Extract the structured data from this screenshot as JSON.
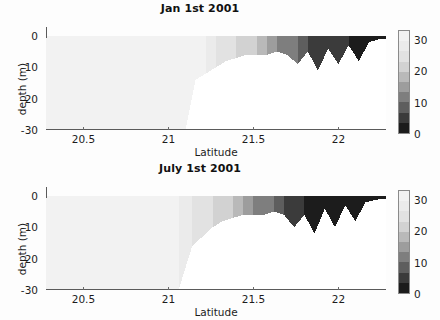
{
  "figure": {
    "background": "#fdfdfd",
    "width": 440,
    "height": 320
  },
  "panels": [
    {
      "key": "jan",
      "title": "Jan 1st 2001",
      "xlabel": "Latitude",
      "ylabel": "depth (m)"
    },
    {
      "key": "july",
      "title": "July 1st 2001",
      "xlabel": "Latitude",
      "ylabel": "depth (m)"
    }
  ],
  "axis": {
    "xticks": [
      20.5,
      21,
      21.5,
      22
    ],
    "xtick_labels": [
      "20.5",
      "21",
      "21.5",
      "22"
    ],
    "xlim": [
      20.28,
      22.28
    ],
    "yticks": [
      0,
      -10,
      -20,
      -30
    ],
    "ytick_labels": [
      "0",
      "-10",
      "-20",
      "-30"
    ],
    "ylim": [
      -30,
      0
    ]
  },
  "colorbar": {
    "ticks": [
      0,
      10,
      20,
      30
    ],
    "tick_labels": [
      "0",
      "10",
      "20",
      "30"
    ],
    "vmin": 0,
    "vmax": 33,
    "orientation": "vertical",
    "position": "right",
    "colors_low_to_high": [
      "#1c1c1c",
      "#3b3b3b",
      "#5e5e5e",
      "#7e7e7e",
      "#9d9d9d",
      "#b9b9b9",
      "#d2d2d2",
      "#e2e2e2",
      "#ebebeb",
      "#f2f2f2"
    ]
  },
  "chart_data": {
    "type": "heatmap",
    "xlabel": "Latitude",
    "ylabel": "depth (m)",
    "xlim": [
      20.28,
      22.28
    ],
    "ylim": [
      -30,
      0
    ],
    "grid": false,
    "legend": "colorbar-right",
    "cmap": "gray",
    "clim": [
      0,
      33
    ],
    "panels": [
      {
        "name": "Jan 1st 2001",
        "comment": "Shelf profile: uniform high values offshore (lat<21.15) to full 30 m depth; seabed shoals rapidly landward with discrete value bands decreasing toward the coast; narrow dark channels incise the nearshore.",
        "bathymetry": [
          {
            "lat": 20.28,
            "seabed_depth": -30,
            "value": 31
          },
          {
            "lat": 20.6,
            "seabed_depth": -30,
            "value": 31
          },
          {
            "lat": 20.9,
            "seabed_depth": -30,
            "value": 31
          },
          {
            "lat": 21.1,
            "seabed_depth": -30,
            "value": 31
          },
          {
            "lat": 21.16,
            "seabed_depth": -14,
            "value": 30
          },
          {
            "lat": 21.22,
            "seabed_depth": -12,
            "value": 29
          },
          {
            "lat": 21.28,
            "seabed_depth": -10,
            "value": 26
          },
          {
            "lat": 21.34,
            "seabed_depth": -8,
            "value": 24
          },
          {
            "lat": 21.4,
            "seabed_depth": -7,
            "value": 22
          },
          {
            "lat": 21.46,
            "seabed_depth": -6,
            "value": 20
          },
          {
            "lat": 21.52,
            "seabed_depth": -6,
            "value": 18
          },
          {
            "lat": 21.58,
            "seabed_depth": -6,
            "value": 15
          },
          {
            "lat": 21.64,
            "seabed_depth": -5,
            "value": 13
          },
          {
            "lat": 21.7,
            "seabed_depth": -6,
            "value": 11
          },
          {
            "lat": 21.76,
            "seabed_depth": -9,
            "value": 8
          },
          {
            "lat": 21.82,
            "seabed_depth": -5,
            "value": 6
          },
          {
            "lat": 21.88,
            "seabed_depth": -11,
            "value": 5
          },
          {
            "lat": 21.94,
            "seabed_depth": -4,
            "value": 4
          },
          {
            "lat": 22.0,
            "seabed_depth": -9,
            "value": 4
          },
          {
            "lat": 22.06,
            "seabed_depth": -3,
            "value": 3
          },
          {
            "lat": 22.12,
            "seabed_depth": -8,
            "value": 3
          },
          {
            "lat": 22.18,
            "seabed_depth": -2,
            "value": 2
          },
          {
            "lat": 22.24,
            "seabed_depth": -1,
            "value": 2
          }
        ]
      },
      {
        "name": "July 1st 2001",
        "comment": "Same bathymetry; value bands shifted seaward with a broader graded staircase and darker, deeper nearshore channels than January.",
        "bathymetry": [
          {
            "lat": 20.28,
            "seabed_depth": -30,
            "value": 30
          },
          {
            "lat": 20.6,
            "seabed_depth": -30,
            "value": 30
          },
          {
            "lat": 20.9,
            "seabed_depth": -30,
            "value": 30
          },
          {
            "lat": 21.06,
            "seabed_depth": -30,
            "value": 28
          },
          {
            "lat": 21.14,
            "seabed_depth": -16,
            "value": 26
          },
          {
            "lat": 21.2,
            "seabed_depth": -13,
            "value": 24
          },
          {
            "lat": 21.26,
            "seabed_depth": -10,
            "value": 22
          },
          {
            "lat": 21.32,
            "seabed_depth": -8,
            "value": 20
          },
          {
            "lat": 21.38,
            "seabed_depth": -7,
            "value": 18
          },
          {
            "lat": 21.44,
            "seabed_depth": -6,
            "value": 16
          },
          {
            "lat": 21.5,
            "seabed_depth": -6,
            "value": 13
          },
          {
            "lat": 21.56,
            "seabed_depth": -6,
            "value": 10
          },
          {
            "lat": 21.62,
            "seabed_depth": -5,
            "value": 8
          },
          {
            "lat": 21.68,
            "seabed_depth": -6,
            "value": 6
          },
          {
            "lat": 21.74,
            "seabed_depth": -10,
            "value": 4
          },
          {
            "lat": 21.8,
            "seabed_depth": -6,
            "value": 3
          },
          {
            "lat": 21.86,
            "seabed_depth": -12,
            "value": 2
          },
          {
            "lat": 21.92,
            "seabed_depth": -4,
            "value": 2
          },
          {
            "lat": 21.98,
            "seabed_depth": -10,
            "value": 2
          },
          {
            "lat": 22.04,
            "seabed_depth": -3,
            "value": 1
          },
          {
            "lat": 22.1,
            "seabed_depth": -8,
            "value": 1
          },
          {
            "lat": 22.16,
            "seabed_depth": -2,
            "value": 1
          },
          {
            "lat": 22.24,
            "seabed_depth": -1,
            "value": 1
          }
        ]
      }
    ]
  }
}
